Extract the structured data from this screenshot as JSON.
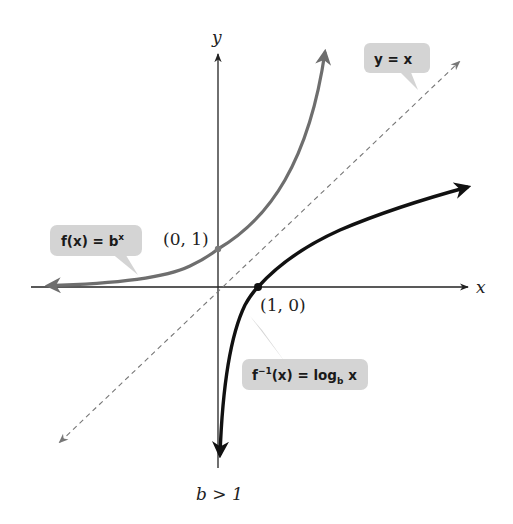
{
  "figure": {
    "axis_labels": {
      "x": "x",
      "y": "y"
    },
    "points": [
      {
        "label": "(0, 1)",
        "x": 0,
        "y": 1
      },
      {
        "label": "(1, 0)",
        "x": 1,
        "y": 0
      }
    ],
    "callouts": {
      "identity": {
        "text": "y = x"
      },
      "exponential": {
        "main": "f(x) = b",
        "sup": "x"
      },
      "logarithm": {
        "pre": "f",
        "sup": "−1",
        "mid": "(x) = log",
        "sub": "b",
        "post": " x"
      }
    },
    "condition": "b > 1",
    "colors": {
      "axes": "#222222",
      "exponential_curve": "#6e6e6e",
      "log_curve": "#111111",
      "identity_line": "#777777",
      "callout_fill": "#d4d4d4"
    }
  }
}
